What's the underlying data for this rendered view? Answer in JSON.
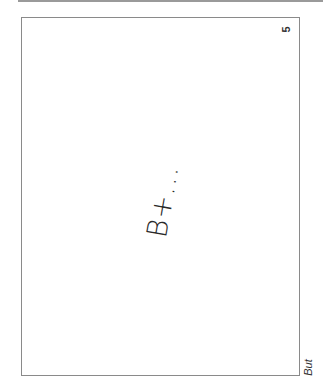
{
  "page": {
    "page_number": "5",
    "handwritten_grade": "B+...",
    "continuation_text": "But",
    "colors": {
      "border": "#8a8a8a",
      "rule": "#9a9a9a",
      "ink": "#2a2a2a"
    }
  }
}
